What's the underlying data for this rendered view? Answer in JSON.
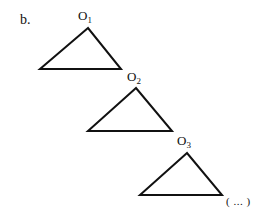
{
  "part_label": "b.",
  "stroke_color": "#111111",
  "background": "#ffffff",
  "triangles": [
    {
      "label_base": "O",
      "label_sub": "1",
      "apex": [
        88,
        28
      ],
      "base_left": [
        40,
        69
      ],
      "base_right": [
        121,
        69
      ],
      "label_pos": [
        78,
        9
      ]
    },
    {
      "label_base": "O",
      "label_sub": "2",
      "apex": [
        136,
        88
      ],
      "base_left": [
        88,
        131
      ],
      "base_right": [
        172,
        131
      ],
      "label_pos": [
        127,
        70
      ]
    },
    {
      "label_base": "O",
      "label_sub": "3",
      "apex": [
        187,
        153
      ],
      "base_left": [
        140,
        195
      ],
      "base_right": [
        222,
        195
      ],
      "label_pos": [
        177,
        134
      ]
    }
  ],
  "continuation": {
    "text": "( ... )",
    "pos": [
      226,
      196
    ]
  }
}
